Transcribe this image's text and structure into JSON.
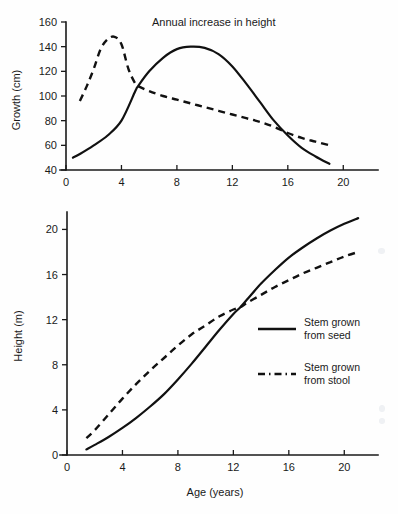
{
  "chart_data": [
    {
      "type": "line",
      "id": "annual-increase-in-height",
      "title": "Annual increase in height",
      "xlabel": "",
      "ylabel": "Growth (cm)",
      "xlim": [
        0,
        22
      ],
      "ylim": [
        40,
        160
      ],
      "xticks": [
        0,
        4,
        8,
        12,
        16,
        20
      ],
      "yticks": [
        40,
        60,
        80,
        100,
        120,
        140,
        160
      ],
      "xtick_labels": [
        "0",
        "4",
        "8",
        "12",
        "16",
        "20"
      ],
      "ytick_labels": [
        "40",
        "60",
        "80",
        "100",
        "120",
        "140",
        "160"
      ],
      "grid": false,
      "legend": "none",
      "series": [
        {
          "name": "Stem grown from seed",
          "style": "solid",
          "x": [
            0.5,
            1,
            2,
            3,
            4,
            5,
            5.2,
            6,
            7,
            8,
            9,
            10,
            11,
            12,
            13,
            14,
            15,
            16,
            17,
            18,
            19
          ],
          "values": [
            50,
            53,
            60,
            68,
            80,
            104,
            108,
            120,
            131,
            138,
            140,
            139,
            134,
            124,
            110,
            95,
            80,
            68,
            58,
            51,
            45
          ]
        },
        {
          "name": "Stem grown from stool",
          "style": "dashed",
          "x": [
            1,
            1.5,
            2,
            2.5,
            3,
            3.5,
            4,
            4.5,
            5,
            5.2,
            6,
            7,
            8,
            9,
            10,
            11,
            12,
            13,
            14,
            15,
            16,
            17,
            18,
            19
          ],
          "values": [
            96,
            108,
            122,
            138,
            146,
            148,
            142,
            122,
            110,
            108,
            104,
            100,
            97,
            94,
            91,
            88,
            85,
            82,
            79,
            75,
            70,
            66,
            63,
            60
          ]
        }
      ]
    },
    {
      "type": "line",
      "id": "height-vs-age",
      "title": "",
      "xlabel": "Age (years)",
      "ylabel": "Height (m)",
      "xlim": [
        0,
        22
      ],
      "ylim": [
        0,
        21.5
      ],
      "xticks": [
        0,
        4,
        8,
        12,
        16,
        20
      ],
      "yticks": [
        0,
        4,
        8,
        12,
        16,
        20
      ],
      "xtick_labels": [
        "0",
        "4",
        "8",
        "12",
        "16",
        "20"
      ],
      "ytick_labels": [
        "0",
        "4",
        "8",
        "12",
        "16",
        "20"
      ],
      "grid": false,
      "legend": "inside-right",
      "series": [
        {
          "name": "Stem grown from seed",
          "style": "solid",
          "x": [
            1.4,
            2,
            3,
            4,
            5,
            6,
            7,
            8,
            9,
            10,
            11,
            12,
            12.5,
            13,
            14,
            15,
            16,
            17,
            18,
            19,
            20,
            21
          ],
          "values": [
            0.5,
            0.9,
            1.6,
            2.4,
            3.3,
            4.3,
            5.4,
            6.7,
            8.1,
            9.6,
            11.1,
            12.5,
            13.1,
            13.8,
            15.2,
            16.4,
            17.5,
            18.4,
            19.2,
            19.9,
            20.5,
            21.0
          ]
        },
        {
          "name": "Stem grown from stool",
          "style": "dashed",
          "x": [
            1.4,
            2,
            3,
            4,
            5,
            6,
            7,
            8,
            9,
            10,
            11,
            12,
            12.5,
            13,
            14,
            15,
            16,
            17,
            18,
            19,
            20,
            21
          ],
          "values": [
            1.5,
            2.2,
            3.6,
            5.0,
            6.3,
            7.5,
            8.6,
            9.7,
            10.7,
            11.5,
            12.3,
            12.9,
            13.1,
            13.5,
            14.2,
            14.9,
            15.5,
            16.1,
            16.6,
            17.1,
            17.6,
            18.0
          ]
        }
      ],
      "legend_entries": [
        {
          "label_line1": "Stem grown",
          "label_line2": "from seed",
          "style": "solid"
        },
        {
          "label_line1": "Stem grown",
          "label_line2": "from stool",
          "style": "dashed"
        }
      ]
    }
  ],
  "colors": {
    "ink": "#111111",
    "background": "#ffffff"
  }
}
